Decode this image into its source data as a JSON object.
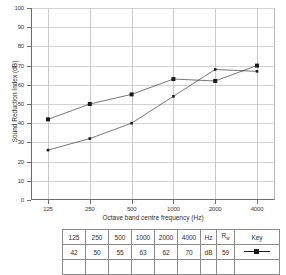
{
  "chart_data": {
    "type": "line",
    "title": "",
    "xlabel": "Octave band centre frequency (Hz)",
    "ylabel": "Sound Reduction Index (dB)",
    "categories": [
      "125",
      "250",
      "500",
      "1000",
      "2000",
      "4000"
    ],
    "xticklabels": [
      "125",
      "250",
      "500",
      "1000",
      "2000",
      "4000"
    ],
    "yticklabels": [
      "0",
      "10",
      "20",
      "30",
      "40",
      "50",
      "60",
      "70",
      "80",
      "90",
      "100"
    ],
    "ylim": [
      0,
      100
    ],
    "ytick_step": 10,
    "grid": "both",
    "legend_position": "table-below",
    "series": [
      {
        "name": "Rw 59 dB",
        "marker": "filled-square",
        "values": [
          42,
          50,
          55,
          63,
          62,
          70
        ]
      },
      {
        "name": "second curve",
        "marker": "small-square",
        "values": [
          26,
          32,
          40,
          54,
          68,
          67
        ]
      }
    ]
  },
  "axes": {
    "y_title": "Sound Reduction Index (dB)",
    "x_title": "Octave band centre frequency (Hz)"
  },
  "table": {
    "header": [
      "125",
      "250",
      "500",
      "1000",
      "2000",
      "4000",
      "Hz",
      "R",
      "Key"
    ],
    "header_rw_base": "R",
    "header_rw_sub": "w",
    "row": [
      "42",
      "50",
      "55",
      "63",
      "62",
      "70",
      "dB",
      "59"
    ],
    "key_marker": "filled-square-with-line"
  },
  "colors": {
    "axis": "#6d6d6d",
    "grid": "#d2d2d2",
    "series": "#1a1a1a",
    "table_border": "#8a8a8a",
    "background": "#ffffff"
  }
}
